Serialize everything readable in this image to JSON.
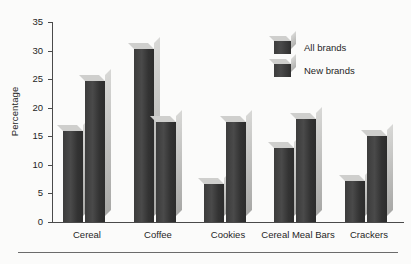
{
  "chart_data": {
    "type": "bar",
    "title": "",
    "subtitle": "",
    "xlabel": "",
    "ylabel": "Percentage",
    "categories": [
      "Cereal",
      "Coffee",
      "Cookies",
      "Cereal Meal Bars",
      "Crackers"
    ],
    "series": [
      {
        "name": "All brands",
        "values": [
          16,
          30.3,
          6.7,
          13,
          7.2
        ]
      },
      {
        "name": "New brands",
        "values": [
          24.7,
          17.5,
          17.5,
          18,
          15
        ]
      }
    ],
    "ylim": [
      0,
      35
    ],
    "yticks": [
      0,
      5,
      10,
      15,
      20,
      25,
      30,
      35
    ],
    "grid": false,
    "legend_position": "top-right",
    "style": "3d-bars",
    "colors": {
      "bar_front": "#3c3c3c",
      "bar_side": "#c4c4c2",
      "bar_top": "#cfcfcd",
      "axis": "#4a4a4a",
      "text": "#1f1f1f",
      "background": "#fbfbfa"
    }
  },
  "legend": {
    "items": [
      {
        "label": "All brands"
      },
      {
        "label": "New brands"
      }
    ]
  }
}
